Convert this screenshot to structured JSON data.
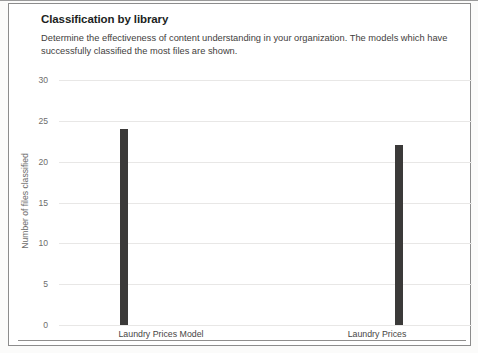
{
  "page": {
    "title": "Classification by library",
    "subtitle_line1": "Determine the effectiveness of content understanding in your organization. The models which have",
    "subtitle_line2": "successfully classified the most files are shown."
  },
  "chart_data": {
    "type": "bar",
    "title": "Classification by library",
    "categories": [
      "Laundry Prices Model",
      "Laundry Prices"
    ],
    "values": [
      24,
      22
    ],
    "xlabel": "",
    "ylabel": "Number of files classified",
    "yticks": [
      0,
      5,
      10,
      15,
      20,
      25,
      30
    ],
    "ylim": [
      0,
      30
    ],
    "grid": true,
    "legend": false,
    "bar_color": "#3b3a39",
    "gridline_color": "#e8e7e6",
    "axis_text_color": "#6e6d6c"
  }
}
